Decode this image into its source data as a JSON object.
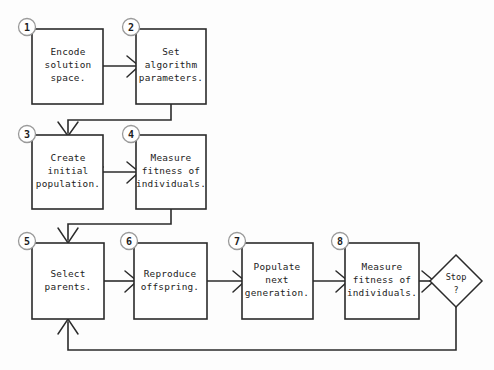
{
  "diagram": {
    "background_color": "#fdfdfd",
    "line_color": "#2b2b2b",
    "nodes": [
      {
        "id": "n1",
        "step": "1",
        "shape": "process",
        "lines": [
          "Encode",
          "solution",
          "space."
        ],
        "x": 32,
        "y": 29,
        "w": 71,
        "h": 75
      },
      {
        "id": "n2",
        "step": "2",
        "shape": "process",
        "lines": [
          "Set",
          "algorithm",
          "parameters."
        ],
        "x": 136,
        "y": 29,
        "w": 70,
        "h": 75
      },
      {
        "id": "n3",
        "step": "3",
        "shape": "process",
        "lines": [
          "Create",
          "initial",
          "population."
        ],
        "x": 32,
        "y": 135,
        "w": 71,
        "h": 74
      },
      {
        "id": "n4",
        "step": "4",
        "shape": "process",
        "lines": [
          "Measure",
          "fitness of",
          "individuals."
        ],
        "x": 136,
        "y": 135,
        "w": 70,
        "h": 74
      },
      {
        "id": "n5",
        "step": "5",
        "shape": "process",
        "lines": [
          "Select",
          "parents."
        ],
        "x": 32,
        "y": 243,
        "w": 72,
        "h": 76
      },
      {
        "id": "n6",
        "step": "6",
        "shape": "process",
        "lines": [
          "Reproduce",
          "offspring."
        ],
        "x": 134,
        "y": 243,
        "w": 73,
        "h": 76
      },
      {
        "id": "n7",
        "step": "7",
        "shape": "process",
        "lines": [
          "Populate",
          "next",
          "generation."
        ],
        "x": 242,
        "y": 243,
        "w": 71,
        "h": 76
      },
      {
        "id": "n8",
        "step": "8",
        "shape": "process",
        "lines": [
          "Measure",
          "fitness of",
          "individuals."
        ],
        "x": 345,
        "y": 243,
        "w": 74,
        "h": 76
      },
      {
        "id": "d1",
        "step": "",
        "shape": "decision",
        "lines": [
          "Stop",
          "?"
        ],
        "cx": 456,
        "cy": 281,
        "rx": 26,
        "ry": 26
      }
    ],
    "edges": [
      {
        "id": "e1",
        "from": "n1",
        "to": "n2",
        "kind": "horizontal"
      },
      {
        "id": "e2",
        "from": "n2",
        "to": "n3",
        "kind": "down-left-down"
      },
      {
        "id": "e3",
        "from": "n3",
        "to": "n4",
        "kind": "horizontal"
      },
      {
        "id": "e4",
        "from": "n4",
        "to": "n5",
        "kind": "down-left-down"
      },
      {
        "id": "e5",
        "from": "n5",
        "to": "n6",
        "kind": "horizontal"
      },
      {
        "id": "e6",
        "from": "n6",
        "to": "n7",
        "kind": "horizontal"
      },
      {
        "id": "e7",
        "from": "n7",
        "to": "n8",
        "kind": "horizontal"
      },
      {
        "id": "e8",
        "from": "n8",
        "to": "d1",
        "kind": "horizontal"
      },
      {
        "id": "e9",
        "from": "d1",
        "to": "n5",
        "kind": "feedback-loop"
      }
    ]
  }
}
